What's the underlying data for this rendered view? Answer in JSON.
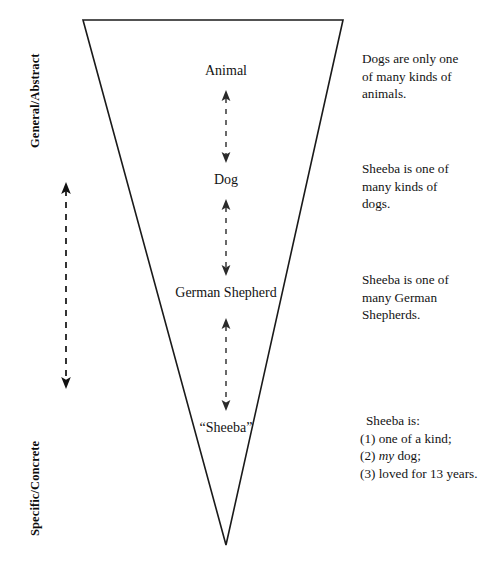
{
  "figure": {
    "type": "inverted-triangle-ladder-of-abstraction",
    "axis_labels": {
      "top": "General/Abstract",
      "bottom": "Specific/Concrete"
    },
    "tiers": [
      {
        "id": "animal",
        "label": "Animal",
        "level": 1
      },
      {
        "id": "dog",
        "label": "Dog",
        "level": 2
      },
      {
        "id": "german-shepherd",
        "label": "German Shepherd",
        "level": 3
      },
      {
        "id": "sheeba",
        "label": "“Sheeba”",
        "level": 4
      }
    ],
    "notes": [
      {
        "id": "note-animals",
        "lines": [
          {
            "text": "Dogs are only one"
          },
          {
            "text": "of many kinds of"
          },
          {
            "text": "animals."
          }
        ]
      },
      {
        "id": "note-dogs",
        "lines": [
          {
            "text": "Sheeba is one of"
          },
          {
            "text": "many kinds of"
          },
          {
            "text": "dogs."
          }
        ]
      },
      {
        "id": "note-shepherds",
        "lines": [
          {
            "text": "Sheeba is one of"
          },
          {
            "text": "many German"
          },
          {
            "text": "Shepherds."
          }
        ]
      },
      {
        "id": "note-sheeba",
        "lines": [
          {
            "text": "Sheeba is:"
          },
          {
            "text": "(1) one of a kind;"
          },
          {
            "pre": "(2) ",
            "em": "my",
            "post": " dog;"
          },
          {
            "text": "(3) loved for 13 years."
          }
        ]
      }
    ],
    "colors": {
      "stroke": "#1a1a1a",
      "text": "#131313",
      "background": "#ffffff"
    }
  }
}
